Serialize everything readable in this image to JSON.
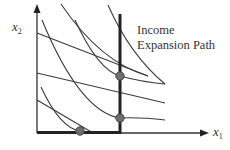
{
  "diagram": {
    "type": "consumer-choice-income-expansion",
    "colors": {
      "background": "#ffffff",
      "line": "#3a3a3a",
      "thick_line": "#222222",
      "dot_fill": "#6e6e6e",
      "dot_stroke": "#444444",
      "text": "#333333"
    },
    "axes": {
      "y_label_base": "x",
      "y_label_sub": "2",
      "x_label_base": "x",
      "x_label_sub": "1"
    },
    "annotation": {
      "line1": "Income",
      "line2": "Expansion Path"
    },
    "budget_lines": [
      {
        "x1": 37,
        "y1": 33,
        "x2": 148,
        "y2": 76
      },
      {
        "x1": 37,
        "y1": 73,
        "x2": 165,
        "y2": 103
      },
      {
        "x1": 37,
        "y1": 100,
        "x2": 93,
        "y2": 133
      }
    ],
    "equilibrium_points": [
      {
        "x": 120,
        "y": 76
      },
      {
        "x": 120,
        "y": 118
      },
      {
        "x": 80,
        "y": 131
      }
    ]
  }
}
